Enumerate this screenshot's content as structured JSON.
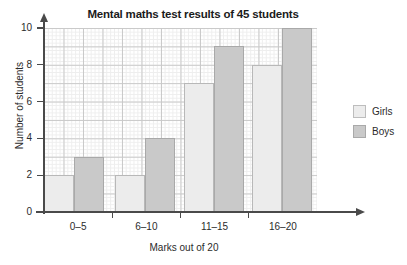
{
  "chart_data": {
    "type": "bar",
    "title": "Mental maths test results of 45 students",
    "xlabel": "Marks out of 20",
    "ylabel": "Number of students",
    "categories": [
      "0–5",
      "6–10",
      "11–15",
      "16–20"
    ],
    "series": [
      {
        "name": "Girls",
        "values": [
          2,
          2,
          7,
          8
        ],
        "color": "#ececec"
      },
      {
        "name": "Boys",
        "values": [
          3,
          4,
          9,
          10
        ],
        "color": "#c9c9c9"
      }
    ],
    "ylim": [
      0,
      10
    ],
    "yticks": [
      0,
      2,
      4,
      6,
      8,
      10
    ],
    "ytick_labels": [
      "0",
      "2",
      "4",
      "6",
      "8",
      "10"
    ],
    "grid": true,
    "grid_style": "graph-paper",
    "legend_position": "right"
  },
  "legend": {
    "entries": [
      {
        "label": "Girls"
      },
      {
        "label": "Boys"
      }
    ]
  }
}
